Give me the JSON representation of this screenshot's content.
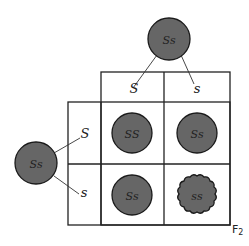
{
  "diagram": {
    "type": "punnett-square",
    "generation_label": "F",
    "generation_sub": "2",
    "parent_top": {
      "genotype": "Ss"
    },
    "parent_left": {
      "genotype": "Ss"
    },
    "gametes_top": [
      "S",
      "s"
    ],
    "gametes_left": [
      "S",
      "s"
    ],
    "cells": [
      {
        "genotype": "SS",
        "shape": "round"
      },
      {
        "genotype": "Ss",
        "shape": "round"
      },
      {
        "genotype": "Ss",
        "shape": "round"
      },
      {
        "genotype": "ss",
        "shape": "wrinkled"
      }
    ],
    "colors": {
      "pea_fill": "#666666",
      "line": "#222222"
    }
  }
}
